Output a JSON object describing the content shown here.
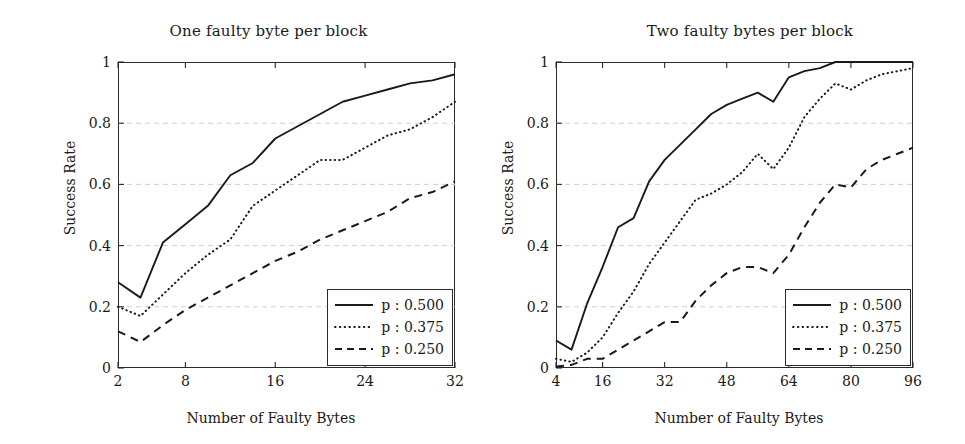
{
  "figure": {
    "panels": [
      {
        "id": "one-faulty-byte",
        "title": "One faulty byte per block",
        "xlabel": "Number of Faulty Bytes",
        "ylabel": "Success Rate"
      },
      {
        "id": "two-faulty-bytes",
        "title": "Two faulty bytes per block",
        "xlabel": "Number of Faulty Bytes",
        "ylabel": "Success Rate"
      }
    ],
    "legend": {
      "entries": [
        {
          "label": "p : 0.500",
          "symbol": "p",
          "value": "0.500",
          "style": "solid"
        },
        {
          "label": "p : 0.375",
          "symbol": "p",
          "value": "0.375",
          "style": "dotted"
        },
        {
          "label": "p : 0.250",
          "symbol": "p",
          "value": "0.250",
          "style": "dashed"
        }
      ]
    }
  },
  "chart_data": [
    {
      "type": "line",
      "title": "One faulty byte per block",
      "xlabel": "Number of Faulty Bytes",
      "ylabel": "Success Rate",
      "xlim": [
        2,
        32
      ],
      "ylim": [
        0,
        1
      ],
      "xticks": [
        2,
        8,
        16,
        24,
        32
      ],
      "xtick_labels": [
        "2",
        "8",
        "16",
        "24",
        "32"
      ],
      "yticks": [
        0,
        0.2,
        0.4,
        0.6,
        0.8,
        1
      ],
      "ytick_labels": [
        "0",
        "0.2",
        "0.4",
        "0.6",
        "0.8",
        "1"
      ],
      "grid": "horizontal-dashed",
      "legend_position": "bottom-right",
      "x": [
        2,
        4,
        6,
        8,
        10,
        12,
        14,
        16,
        18,
        20,
        22,
        24,
        26,
        28,
        30,
        32
      ],
      "series": [
        {
          "name": "p : 0.500",
          "style": "solid",
          "values": [
            0.28,
            0.23,
            0.41,
            0.47,
            0.53,
            0.63,
            0.67,
            0.75,
            0.79,
            0.83,
            0.87,
            0.89,
            0.91,
            0.93,
            0.94,
            0.96
          ]
        },
        {
          "name": "p : 0.375",
          "style": "dotted",
          "values": [
            0.2,
            0.17,
            0.24,
            0.31,
            0.37,
            0.42,
            0.53,
            0.58,
            0.63,
            0.68,
            0.68,
            0.72,
            0.76,
            0.78,
            0.82,
            0.87
          ]
        },
        {
          "name": "p : 0.250",
          "style": "dashed",
          "values": [
            0.12,
            0.085,
            0.14,
            0.19,
            0.23,
            0.27,
            0.31,
            0.35,
            0.38,
            0.42,
            0.45,
            0.48,
            0.51,
            0.555,
            0.575,
            0.61
          ]
        }
      ]
    },
    {
      "type": "line",
      "title": "Two faulty bytes per block",
      "xlabel": "Number of Faulty Bytes",
      "ylabel": "Success Rate",
      "xlim": [
        4,
        96
      ],
      "ylim": [
        0,
        1
      ],
      "xticks": [
        4,
        16,
        32,
        48,
        64,
        80,
        96
      ],
      "xtick_labels": [
        "4",
        "16",
        "32",
        "48",
        "64",
        "80",
        "96"
      ],
      "yticks": [
        0,
        0.2,
        0.4,
        0.6,
        0.8,
        1
      ],
      "ytick_labels": [
        "0",
        "0.2",
        "0.4",
        "0.6",
        "0.8",
        "1"
      ],
      "grid": "horizontal-dashed",
      "legend_position": "bottom-right",
      "x": [
        4,
        8,
        12,
        16,
        20,
        24,
        28,
        32,
        36,
        40,
        44,
        48,
        52,
        56,
        60,
        64,
        68,
        72,
        76,
        80,
        84,
        88,
        92,
        96
      ],
      "series": [
        {
          "name": "p : 0.500",
          "style": "solid",
          "values": [
            0.09,
            0.06,
            0.21,
            0.33,
            0.46,
            0.49,
            0.61,
            0.68,
            0.73,
            0.78,
            0.83,
            0.86,
            0.88,
            0.9,
            0.87,
            0.95,
            0.97,
            0.98,
            1.0,
            1.0,
            1.0,
            1.0,
            1.0,
            1.0
          ]
        },
        {
          "name": "p : 0.375",
          "style": "dotted",
          "values": [
            0.03,
            0.02,
            0.05,
            0.1,
            0.18,
            0.25,
            0.34,
            0.41,
            0.48,
            0.55,
            0.57,
            0.6,
            0.64,
            0.7,
            0.65,
            0.72,
            0.82,
            0.88,
            0.93,
            0.91,
            0.94,
            0.96,
            0.97,
            0.98
          ]
        },
        {
          "name": "p : 0.250",
          "style": "dashed",
          "values": [
            0.005,
            0.01,
            0.03,
            0.03,
            0.06,
            0.09,
            0.12,
            0.15,
            0.15,
            0.22,
            0.27,
            0.31,
            0.33,
            0.33,
            0.31,
            0.37,
            0.46,
            0.54,
            0.6,
            0.59,
            0.65,
            0.68,
            0.7,
            0.72
          ]
        }
      ]
    }
  ]
}
